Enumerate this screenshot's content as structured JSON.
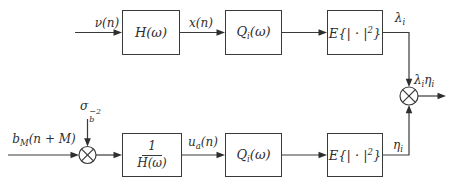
{
  "colors": {
    "background": "#ffffff",
    "line": "#3a3a3a",
    "text": "#2e2e2e"
  },
  "blocks": {
    "h": {
      "label": "H(ω)"
    },
    "q_top": {
      "base": "Q",
      "sub": "i",
      "rest": "(ω)"
    },
    "e_top": {
      "pre": "E{| · |",
      "sup": "2",
      "post": "}"
    },
    "inv_h": {
      "num": "1",
      "den": "H(ω)"
    },
    "q_bottom": {
      "base": "Q",
      "sub": "i",
      "rest": "(ω)"
    },
    "e_bottom": {
      "pre": "E{| · |",
      "sup": "2",
      "post": "}"
    }
  },
  "signals": {
    "nu": {
      "label": "ν(n)"
    },
    "x": {
      "label": "x(n)"
    },
    "lambda": {
      "base": "λ",
      "sub": "i"
    },
    "b": {
      "base": "b",
      "sub": "M",
      "rest": "(n + M)"
    },
    "sigma": {
      "base": "σ",
      "sup": "−2",
      "sub": "b"
    },
    "u": {
      "base": "u",
      "sub": "a",
      "rest": "(n)"
    },
    "eta": {
      "base": "η",
      "sub": "i"
    },
    "output": {
      "lambda_base": "λ",
      "lambda_sub": "i",
      "eta_base": "η",
      "eta_sub": "i"
    }
  }
}
